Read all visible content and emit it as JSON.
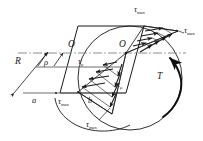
{
  "figure": {
    "colors": {
      "outline": "#1a1a1a",
      "centerline": "#8c8c8c",
      "solid_rule": "#6e6e6e",
      "label": "#1a1a1a",
      "background": "#ffffff"
    },
    "labels": {
      "tau_max_top": {
        "sym": "τ",
        "sub": "max"
      },
      "tau_max_right": {
        "sym": "τ",
        "sub": "max"
      },
      "tau_max_left_bottom": {
        "sym": "τ",
        "sub": "max"
      },
      "tau_max_bottom": {
        "sym": "τ",
        "sub": "max"
      },
      "tau_rho_upper": {
        "sym": "τ",
        "sub": "ρ"
      },
      "tau_rho_lower": {
        "sym": "τ",
        "sub": "ρ"
      },
      "origin_left": {
        "sym": "O",
        "sub": ""
      },
      "origin_right": {
        "sym": "O",
        "sub": ""
      },
      "radius": {
        "sym": "R",
        "sub": ""
      },
      "rho": {
        "sym": "ρ",
        "sub": ""
      },
      "point_a": {
        "sym": "a",
        "sub": ""
      },
      "point_b": {
        "sym": "b",
        "sub": ""
      },
      "torque": {
        "sym": "T",
        "sub": ""
      }
    },
    "elements": {
      "shaft_circle": "circular-shaft-cross-section",
      "cut_plane": "diametral-cut-plane",
      "stress_triangle_upper": "upper-shear-stress-triangle",
      "stress_triangle_lower": "lower-shear-stress-triangle",
      "torque_arc": "torque-direction-arc",
      "center_axis": "neutral-axis-centerline",
      "radius_arrow": "radius-dimension-arrow",
      "rho_arrow": "rho-dimension-arrow"
    }
  }
}
